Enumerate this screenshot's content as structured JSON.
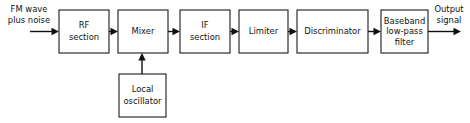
{
  "diagram": {
    "stroke_color": "#111111",
    "box_fill": "#ffffff",
    "background": "#ffffff",
    "blocks": [
      {
        "id": "rf",
        "lines": [
          "RF",
          "section"
        ],
        "x": 59,
        "y": 10,
        "w": 50,
        "h": 43
      },
      {
        "id": "mixer",
        "lines": [
          "Mixer"
        ],
        "x": 118,
        "y": 10,
        "w": 50,
        "h": 43
      },
      {
        "id": "if",
        "lines": [
          "IF",
          "section"
        ],
        "x": 180,
        "y": 10,
        "w": 50,
        "h": 43
      },
      {
        "id": "limiter",
        "lines": [
          "Limiter"
        ],
        "x": 239,
        "y": 10,
        "w": 49,
        "h": 43
      },
      {
        "id": "discriminator",
        "lines": [
          "Discriminator"
        ],
        "x": 297,
        "y": 10,
        "w": 71,
        "h": 43
      },
      {
        "id": "baseband",
        "lines": [
          "Baseband",
          "low-pass",
          "filter"
        ],
        "x": 381,
        "y": 10,
        "w": 47,
        "h": 43
      },
      {
        "id": "local-oscillator",
        "lines": [
          "Local",
          "oscillator"
        ],
        "x": 119,
        "y": 74,
        "w": 47,
        "h": 43
      }
    ],
    "io_labels": [
      {
        "id": "input-label",
        "lines": [
          "FM wave",
          "plus noise"
        ],
        "cx": 29,
        "cy": 12
      },
      {
        "id": "output-label",
        "lines": [
          "Output",
          "signal"
        ],
        "cx": 449,
        "cy": 12
      }
    ],
    "connections": [
      {
        "id": "input-to-rf",
        "from": "input",
        "to": "rf"
      },
      {
        "id": "rf-to-mixer",
        "from": "rf",
        "to": "mixer"
      },
      {
        "id": "mixer-to-if",
        "from": "mixer",
        "to": "if"
      },
      {
        "id": "if-to-limiter",
        "from": "if",
        "to": "limiter"
      },
      {
        "id": "limiter-to-discriminator",
        "from": "limiter",
        "to": "discriminator"
      },
      {
        "id": "discriminator-to-baseband",
        "from": "discriminator",
        "to": "baseband"
      },
      {
        "id": "baseband-to-output",
        "from": "baseband",
        "to": "output"
      },
      {
        "id": "oscillator-to-mixer",
        "from": "local-oscillator",
        "to": "mixer"
      }
    ]
  }
}
